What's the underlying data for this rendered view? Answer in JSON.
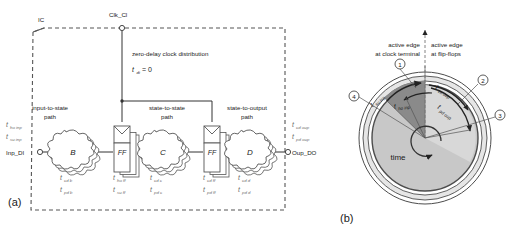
{
  "figure": {
    "panel_a_label": "(a)",
    "panel_b_label": "(b)"
  },
  "panel_a": {
    "chip_label": "IC",
    "clock_terminal": "Clk_Cl",
    "clock_note_line1": "zero-delay clock distribution",
    "clock_note_sym": "t",
    "clock_note_sub": "di",
    "clock_note_val": " = 0",
    "input_terminal": "Inp_DI",
    "output_terminal": "Oup_DO",
    "input_timing": [
      {
        "sym": "t",
        "sub": "ho inp"
      },
      {
        "sym": "t",
        "sub": "su inp"
      }
    ],
    "output_timing": [
      {
        "sym": "t",
        "sub": "cd oup"
      },
      {
        "sym": "t",
        "sub": "pd oup"
      }
    ],
    "paths": [
      {
        "line1": "input-to-state",
        "line2": "path"
      },
      {
        "line1": "state-to-state",
        "line2": "path"
      },
      {
        "line1": "state-to-output",
        "line2": "path"
      }
    ],
    "blocks": [
      {
        "name": "B",
        "type": "cloud",
        "t_top": {
          "sym": "t",
          "sub": "cd b"
        },
        "t_bot": {
          "sym": "t",
          "sub": "pd b"
        }
      },
      {
        "name": "FF",
        "type": "register",
        "t_top": {
          "sym": "t",
          "sub": "ho ff"
        },
        "t_bot": {
          "sym": "t",
          "sub": "su ff"
        }
      },
      {
        "name": "C",
        "type": "cloud",
        "t_top": {
          "sym": "t",
          "sub": "cd c"
        },
        "t_bot": {
          "sym": "t",
          "sub": "pd c"
        }
      },
      {
        "name": "FF",
        "type": "register",
        "t_top": {
          "sym": "t",
          "sub": "cd ff"
        },
        "t_bot": {
          "sym": "t",
          "sub": "pd ff"
        }
      },
      {
        "name": "D",
        "type": "cloud",
        "t_top": {
          "sym": "t",
          "sub": "cd d"
        },
        "t_bot": {
          "sym": "t",
          "sub": "pd d"
        }
      }
    ]
  },
  "panel_b": {
    "header_left_line1": "active edge",
    "header_left_line2": "at clock terminal",
    "header_right_line1": "active edge",
    "header_right_line2": "at flip-flops",
    "time_label": "time",
    "callouts": [
      {
        "id": "1",
        "glyph": "①"
      },
      {
        "id": "2",
        "glyph": "②"
      },
      {
        "id": "3",
        "glyph": "③"
      },
      {
        "id": "4",
        "glyph": "④"
      }
    ],
    "arc_labels": [
      {
        "sym": "t",
        "sub": "su inp"
      },
      {
        "sym": "t",
        "sub": "cd oup"
      },
      {
        "sym": "t",
        "sub": "ho inp"
      },
      {
        "sym": "t",
        "sub": "pd oup"
      }
    ],
    "colors": {
      "disc_fill": "#c8c8c8",
      "band_fill": "#e6e6e6",
      "dark_segment": "#8a8a8a",
      "outline": "#4d4d4d"
    }
  }
}
